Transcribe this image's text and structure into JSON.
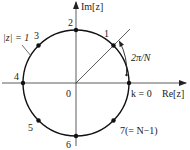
{
  "diagram": {
    "axes": {
      "real_label": "Re[z]",
      "imag_label": "Im[z]",
      "origin_label": "0"
    },
    "circle_label": "|z| = 1",
    "angle_label": "2π/N",
    "points": [
      {
        "k": 0,
        "label": "k = 0"
      },
      {
        "k": 1,
        "label": "1"
      },
      {
        "k": 2,
        "label": "2"
      },
      {
        "k": 3,
        "label": "3"
      },
      {
        "k": 4,
        "label": "4"
      },
      {
        "k": 5,
        "label": "5"
      },
      {
        "k": 6,
        "label": "6"
      },
      {
        "k": 7,
        "label": "7(= N−1)"
      }
    ],
    "N": 8
  }
}
